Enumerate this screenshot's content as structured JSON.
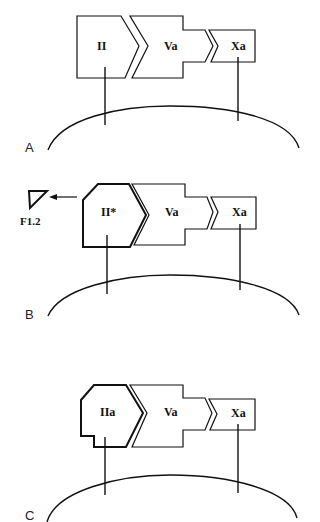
{
  "panels": [
    {
      "label": "A",
      "proteins": [
        "II",
        "Va",
        "Xa"
      ]
    },
    {
      "label": "B",
      "proteins": [
        "II*",
        "Va",
        "Xa"
      ],
      "fragment": "F1.2"
    },
    {
      "label": "C",
      "proteins": [
        "IIa",
        "Va",
        "Xa"
      ]
    }
  ]
}
